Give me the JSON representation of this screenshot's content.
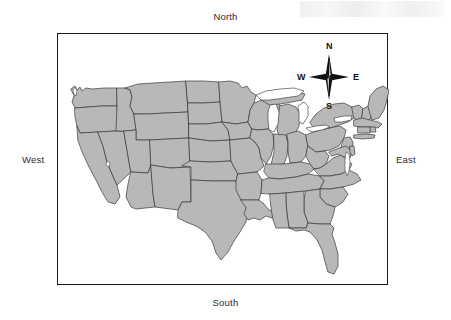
{
  "figure": {
    "background_color": "#ffffff"
  },
  "frame": {
    "border_color": "#1a1a1a",
    "fill_color": "#ffffff"
  },
  "direction_labels": {
    "north": "North",
    "south": "South",
    "west": "West",
    "east": "East"
  },
  "compass_rose": {
    "name": "compass-rose",
    "north": "N",
    "south": "S",
    "east": "E",
    "west": "W",
    "star_color": "#111111",
    "points": 4
  },
  "map": {
    "region": "Contiguous United States",
    "fill_color": "#b8b8b8",
    "border_color": "#3a3a3a",
    "water_color": "#ffffff",
    "features": [
      "state-boundaries",
      "great-lakes",
      "florida-peninsula",
      "texas-gulf-coast",
      "chesapeake-bay",
      "puget-sound",
      "cape-cod",
      "long-island"
    ]
  }
}
